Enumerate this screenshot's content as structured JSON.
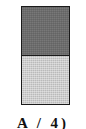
{
  "figure": {
    "kind": "two-tone-stacked-bar",
    "background_color": "#ffffff",
    "border_color": "#1a1a1a",
    "alt": "Vertical rectangle divided into two equal halves: dark gray above, light gray below"
  },
  "bar": {
    "segments": [
      {
        "name": "upper-segment",
        "label": "dark gray upper half",
        "color": "#6b6b6b",
        "fraction": 0.5
      },
      {
        "name": "lower-segment",
        "label": "light gray lower half",
        "color": "#c9c9c9",
        "fraction": 0.5
      }
    ]
  },
  "caption": {
    "text": "A / 4)",
    "note": "caption is cropped by the bottom edge of the image; only the tops of the glyphs are visible"
  },
  "chart_data": {
    "type": "bar",
    "title": "",
    "subtitle": "",
    "xlabel": "",
    "ylabel": "",
    "categories": [
      "single-bar"
    ],
    "series": [
      {
        "name": "dark gray upper half",
        "values": [
          50
        ],
        "color": "#6b6b6b"
      },
      {
        "name": "light gray lower half",
        "values": [
          50
        ],
        "color": "#c9c9c9"
      }
    ],
    "stacked": true,
    "ylim": [
      0,
      100
    ],
    "grid": false,
    "legend": "none",
    "tick_labels": [],
    "annotations": [
      "A / 4)"
    ]
  }
}
